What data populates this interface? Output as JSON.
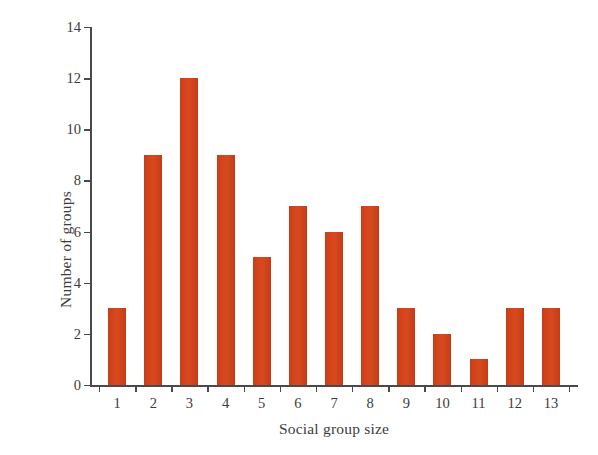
{
  "chart_data": {
    "type": "bar",
    "title": "",
    "subtitle": "",
    "xlabel": "Social group size",
    "ylabel": "Number of groups",
    "categories": [
      "1",
      "2",
      "3",
      "4",
      "5",
      "6",
      "7",
      "8",
      "9",
      "10",
      "11",
      "12",
      "13"
    ],
    "values": [
      3,
      9,
      12,
      9,
      5,
      7,
      6,
      7,
      3,
      2,
      1,
      3,
      3
    ],
    "series": [
      {
        "name": "Number of groups",
        "values": [
          3,
          9,
          12,
          9,
          5,
          7,
          6,
          7,
          3,
          2,
          1,
          3,
          3
        ]
      }
    ],
    "ylim": [
      0,
      14
    ],
    "ytick_values": [
      0,
      2,
      4,
      6,
      8,
      10,
      12,
      14
    ],
    "ytick_labels": [
      "0",
      "2",
      "4",
      "6",
      "8",
      "10",
      "12",
      "14"
    ],
    "xtick_labels": [
      "1",
      "2",
      "3",
      "4",
      "5",
      "6",
      "7",
      "8",
      "9",
      "10",
      "11",
      "12",
      "13"
    ],
    "grid": false,
    "legend": false,
    "legend_position": "none",
    "bar_color": "#d2431a",
    "axis_color": "#4a4a4a",
    "text_color": "#3c3c3c",
    "background_color": "#ffffff",
    "annotations": []
  }
}
